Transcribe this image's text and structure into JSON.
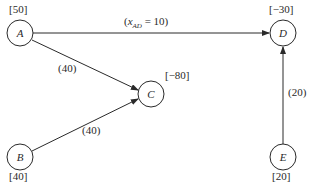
{
  "diagram": {
    "type": "network-flow",
    "nodes": [
      {
        "id": "A",
        "label": "A",
        "supply": "[50]"
      },
      {
        "id": "B",
        "label": "B",
        "supply": "[40]"
      },
      {
        "id": "C",
        "label": "C",
        "supply": "[−80]"
      },
      {
        "id": "D",
        "label": "D",
        "supply": "[−30]"
      },
      {
        "id": "E",
        "label": "E",
        "supply": "[20]"
      }
    ],
    "edges": [
      {
        "from": "A",
        "to": "D",
        "label_prefix": "(",
        "var": "x",
        "var_sub": "AD",
        "label_suffix": " = 10)"
      },
      {
        "from": "A",
        "to": "C",
        "label": "(40)"
      },
      {
        "from": "B",
        "to": "C",
        "label": "(40)"
      },
      {
        "from": "E",
        "to": "D",
        "label": "(20)"
      }
    ]
  },
  "colors": {
    "line": "#2a2a2a",
    "background": "#ffffff"
  }
}
